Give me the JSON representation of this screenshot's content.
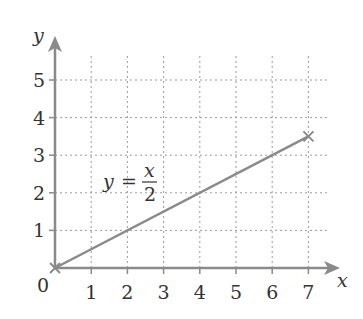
{
  "chart_data": {
    "type": "line",
    "title": "",
    "xlabel": "x",
    "ylabel": "y",
    "origin_label": "0",
    "xlim": [
      0,
      7.8
    ],
    "ylim": [
      0,
      5.7
    ],
    "x_ticks": [
      1,
      2,
      3,
      4,
      5,
      6,
      7
    ],
    "y_ticks": [
      1,
      2,
      3,
      4,
      5
    ],
    "grid": true,
    "grid_style": "dotted",
    "legend": null,
    "series": [
      {
        "name": "y = x/2",
        "x": [
          0,
          7
        ],
        "y": [
          0,
          3.5
        ],
        "endpoint_markers": [
          "x",
          "x"
        ]
      }
    ],
    "annotations": [
      {
        "text_lhs": "y",
        "text_eq": "=",
        "numerator": "x",
        "denominator": "2",
        "position": [
          2,
          2.5
        ]
      }
    ],
    "colors": {
      "line": "#8a8a8a",
      "axis": "#8a8a8a",
      "grid": "#9a9a9a",
      "text": "#333333"
    }
  }
}
